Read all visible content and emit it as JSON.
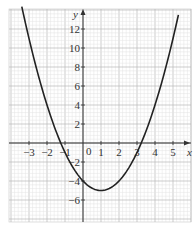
{
  "chart_data": {
    "type": "line",
    "title": "",
    "xlabel": "x",
    "ylabel": "y",
    "equation": "y = x^2 - 2x - 4",
    "xlim": [
      -4,
      5.8
    ],
    "ylim": [
      -8,
      14
    ],
    "x_ticks": [
      -3,
      -2,
      -1,
      1,
      2,
      3,
      4,
      5
    ],
    "x_tick_labels": [
      "−3",
      "−2",
      "−1",
      "1",
      "2",
      "3",
      "4",
      "5"
    ],
    "y_ticks": [
      -6,
      -4,
      -2,
      2,
      4,
      6,
      8,
      10,
      12
    ],
    "y_tick_labels": [
      "−6",
      "−4",
      "−2",
      "2",
      "4",
      "6",
      "8",
      "10",
      "12"
    ],
    "origin_label": "0",
    "grid": true,
    "legend": null,
    "series": [
      {
        "name": "parabola",
        "x": [
          -3.4,
          -3,
          -2,
          -1,
          0,
          1,
          2,
          3,
          4,
          5,
          5.3
        ],
        "values": [
          14.36,
          11,
          4,
          -1,
          -4,
          -5,
          -4,
          -1,
          4,
          11,
          13.49
        ]
      }
    ],
    "key_points": {
      "vertex": [
        1,
        -5
      ],
      "y_intercept": [
        0,
        -4
      ],
      "roots": [
        -1.24,
        3.24
      ]
    }
  }
}
